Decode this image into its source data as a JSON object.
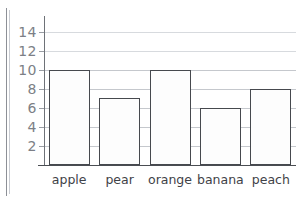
{
  "chart_data": {
    "type": "bar",
    "title": "",
    "subtitle": "",
    "xlabel": "",
    "ylabel": "",
    "categories": [
      "apple",
      "pear",
      "orange",
      "banana",
      "peach"
    ],
    "values": [
      10,
      7,
      10,
      6,
      8
    ],
    "series": [
      {
        "name": "count",
        "values": [
          10,
          7,
          10,
          6,
          8
        ]
      }
    ],
    "ylim": [
      0,
      15
    ],
    "ytick_labels": [
      "2",
      "4",
      "6",
      "8",
      "10",
      "12",
      "14"
    ],
    "ytick_values": [
      2,
      4,
      6,
      8,
      10,
      12,
      14
    ],
    "grid": true,
    "grid_axis": "y",
    "legend": false,
    "legend_position": "none",
    "annotations": [],
    "colors": {
      "bar_fill": "#fdfdfd",
      "bar_outline": "#46494e",
      "gridline": "#c5c8cd",
      "axis": "#4a4d52",
      "ytick_label": "#7c7f86",
      "xtick_label": "#3f4247",
      "background": "#ffffff"
    }
  }
}
